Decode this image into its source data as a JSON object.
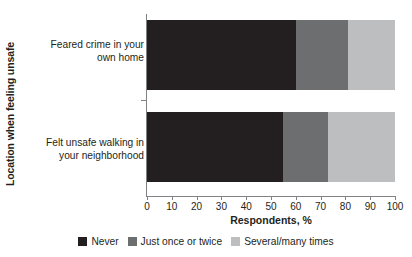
{
  "chart_data": {
    "type": "bar",
    "orientation": "horizontal",
    "stacked": true,
    "title": "",
    "xlabel": "Respondents, %",
    "ylabel": "Location when feeling unsafe",
    "categories": [
      "Feared crime in your own home",
      "Felt unsafe walking in your neighborhood"
    ],
    "category_lines": [
      [
        "Feared crime in your",
        "own home"
      ],
      [
        "Felt unsafe walking in",
        "your neighborhood"
      ]
    ],
    "series": [
      {
        "name": "Never",
        "values": [
          60,
          55
        ],
        "color": "#231f20"
      },
      {
        "name": "Just once or twice",
        "values": [
          21,
          18
        ],
        "color": "#6d6e70"
      },
      {
        "name": "Several/many times",
        "values": [
          19,
          27
        ],
        "color": "#bcbec0"
      }
    ],
    "xlim": [
      0,
      100
    ],
    "xticks": [
      0,
      10,
      20,
      30,
      40,
      50,
      60,
      70,
      80,
      90,
      100
    ],
    "xtick_labels": [
      "0",
      "10",
      "20",
      "30",
      "40",
      "50",
      "60",
      "70",
      "80",
      "90",
      "100"
    ],
    "grid": false,
    "legend_position": "bottom"
  },
  "legend": {
    "items": [
      {
        "label": "Never",
        "color": "#231f20"
      },
      {
        "label": "Just once or twice",
        "color": "#6d6e70"
      },
      {
        "label": "Several/many times",
        "color": "#bcbec0"
      }
    ]
  },
  "colors": {
    "never": "#231f20",
    "just_once_or_twice": "#6d6e70",
    "several_many_times": "#bcbec0",
    "axis": "#808285",
    "text": "#231f20",
    "background": "#ffffff"
  }
}
